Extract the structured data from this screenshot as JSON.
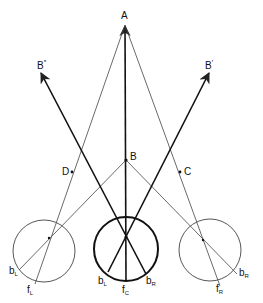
{
  "diagram": {
    "title": "",
    "points": {
      "A": {
        "label": "A",
        "x": 125,
        "y": 25
      },
      "B": {
        "label": "B",
        "x": 126,
        "y": 160
      },
      "C": {
        "label": "C",
        "x": 180,
        "y": 172
      },
      "D": {
        "label": "D",
        "x": 72,
        "y": 172
      },
      "B_prime": {
        "label": "B",
        "mark": "′"
      },
      "B_double_prime": {
        "label": "B",
        "mark": "″"
      }
    },
    "eyes": {
      "left": {
        "b_label": "b",
        "b_sub": "L",
        "f_label": "f",
        "f_sub": "L"
      },
      "center": {
        "b_left_label": "b",
        "b_left_sub": "L",
        "b_right_label": "b",
        "b_right_sub": "R",
        "f_label": "f",
        "f_sub": "C"
      },
      "right": {
        "b_label": "b",
        "b_sub": "R",
        "f_label": "f",
        "f_sub": "R"
      }
    },
    "colors": {
      "line": "#222222",
      "background": "#ffffff"
    }
  }
}
